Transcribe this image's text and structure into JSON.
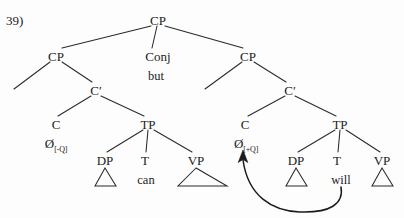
{
  "figure": {
    "example_number": "39)",
    "type": "syntax-tree"
  },
  "nodes": {
    "root_cp": {
      "label": "CP",
      "x": 158,
      "y": 20
    },
    "conj": {
      "label": "Conj",
      "x": 158,
      "y": 56
    },
    "conj_word": {
      "label": "but",
      "x": 156,
      "y": 76
    },
    "left_cp": {
      "label": "CP",
      "x": 56,
      "y": 56
    },
    "left_cbar": {
      "label": "C′",
      "x": 96,
      "y": 90
    },
    "left_c": {
      "label": "C",
      "x": 56,
      "y": 124
    },
    "left_c_null": {
      "label": "Ø",
      "feature": "[-Q]",
      "x": 56,
      "y": 143
    },
    "left_tp": {
      "label": "TP",
      "x": 148,
      "y": 124
    },
    "left_dp": {
      "label": "DP",
      "x": 105,
      "y": 160
    },
    "left_t": {
      "label": "T",
      "x": 145,
      "y": 160
    },
    "left_t_word": {
      "label": "can",
      "x": 146,
      "y": 180
    },
    "left_vp": {
      "label": "VP",
      "x": 196,
      "y": 160
    },
    "right_cp": {
      "label": "CP",
      "x": 248,
      "y": 56
    },
    "right_cbar": {
      "label": "C′",
      "x": 290,
      "y": 90
    },
    "right_c": {
      "label": "C",
      "x": 245,
      "y": 124
    },
    "right_c_null": {
      "label": "Ø",
      "feature": "[+Q]",
      "x": 246,
      "y": 143
    },
    "right_tp": {
      "label": "TP",
      "x": 340,
      "y": 124
    },
    "right_dp": {
      "label": "DP",
      "x": 296,
      "y": 160
    },
    "right_t": {
      "label": "T",
      "x": 337,
      "y": 160
    },
    "right_t_word": {
      "label": "will",
      "x": 341,
      "y": 180
    },
    "right_vp": {
      "label": "VP",
      "x": 382,
      "y": 160
    }
  },
  "movement": {
    "name": "t-to-c-movement",
    "from": "right_t_word",
    "to": "right_c_null",
    "arrowhead": "up"
  },
  "colors": {
    "ink": "#1b1b1b",
    "line": "#2a2a2a",
    "background": "#fdfdfd"
  }
}
